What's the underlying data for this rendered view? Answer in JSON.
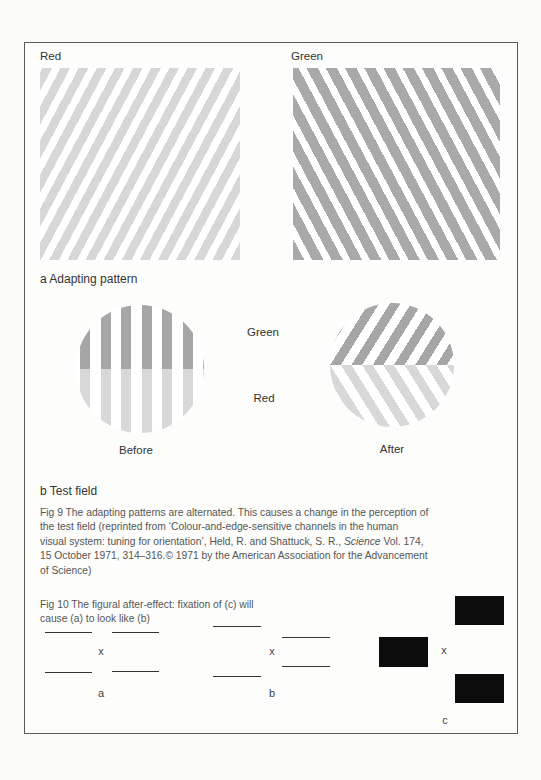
{
  "figure9": {
    "panel_a": {
      "red_label": "Red",
      "green_label": "Green",
      "caption": "a  Adapting pattern",
      "red_stripe_color": "#d7d7d7",
      "green_stripe_color": "#a9a9a9"
    },
    "panel_b": {
      "green_label": "Green",
      "red_label": "Red",
      "before_label": "Before",
      "after_label": "After",
      "caption": "b Test field"
    },
    "caption_lines": [
      "Fig 9 The adapting patterns are alternated. This causes a change in the perception of",
      "the test field (reprinted from ‘Colour-and-edge-sensitive channels in the human",
      "visual system: tuning for orientation’, Held, R. and Shattuck, S. R.,",
      "15 October 1971, 314–316.© 1971 by the American Association for the Advancement",
      "of Science)"
    ],
    "journal": "Science",
    "journal_suffix": " Vol. 174,"
  },
  "figure10": {
    "caption_lines": [
      "Fig 10 The figural after-effect: fixation of (c) will",
      "cause (a) to look like (b)"
    ],
    "fixation_mark": "x",
    "label_a": "a",
    "label_b": "b",
    "label_c": "c"
  }
}
